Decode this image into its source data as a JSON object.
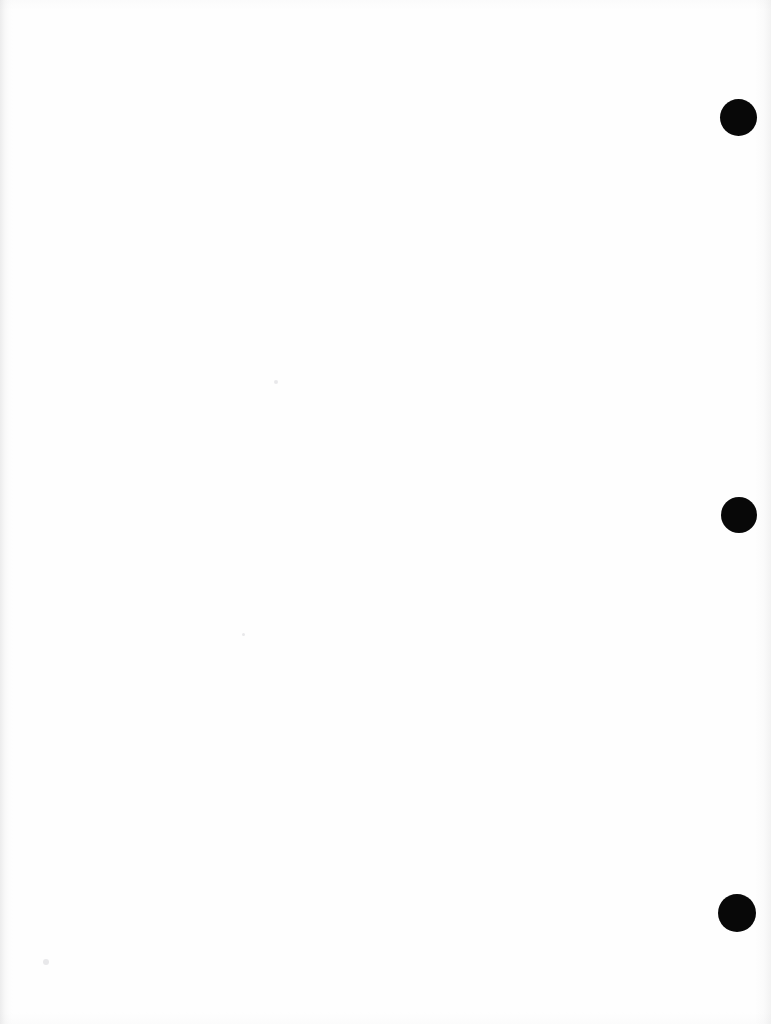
{
  "page": {
    "kind": "scanned-blank-page",
    "width": 771,
    "height": 1024,
    "background_color": "#ffffff",
    "paper_color": "#fefefe",
    "body_text": "",
    "visible_text_count": 0
  },
  "marks": {
    "ink_color": "#080808",
    "punch_holes": [
      {
        "label": "top-punch-hole",
        "cx": 738,
        "cy": 117,
        "diameter": 37
      },
      {
        "label": "middle-punch-hole",
        "cx": 739,
        "cy": 515,
        "diameter": 36
      },
      {
        "label": "bottom-punch-hole",
        "cx": 737,
        "cy": 913,
        "diameter": 38
      }
    ]
  },
  "artifacts": {
    "edge_shadow_color": "#c8c8ca",
    "speck_color": "#e4e4e6",
    "specks": [
      {
        "label": "speck-center",
        "cx": 276,
        "cy": 382,
        "size": 4
      },
      {
        "label": "speck-lower-left",
        "cx": 46,
        "cy": 962,
        "size": 6
      },
      {
        "label": "speck-mid-left",
        "cx": 243,
        "cy": 634,
        "size": 3
      }
    ]
  }
}
